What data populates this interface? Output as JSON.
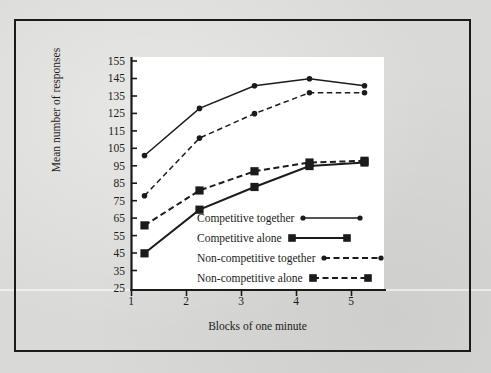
{
  "figure": {
    "background_color": "#d9d9d7",
    "panel_color": "#ffffff",
    "ink_color": "#1b1b1b"
  },
  "chart_data": {
    "type": "line",
    "title": "",
    "subtitle": "",
    "xlabel": "Blocks of one minute",
    "ylabel": "Mean number of responses",
    "categories": [
      "1",
      "2",
      "3",
      "4",
      "5"
    ],
    "x": [
      1,
      2,
      3,
      4,
      5
    ],
    "xlim": [
      0.6,
      5.6
    ],
    "ylim": [
      25,
      155
    ],
    "yticks": [
      25,
      35,
      45,
      55,
      65,
      75,
      85,
      95,
      105,
      115,
      125,
      135,
      145,
      155
    ],
    "xticks": [
      1,
      2,
      3,
      4,
      5
    ],
    "grid": false,
    "legend_position": "inside-lower-right",
    "series": [
      {
        "name": "Competitive together",
        "marker": "circle",
        "line_style": "solid",
        "color": "#1b1b1b",
        "values": [
          102,
          129,
          142,
          146,
          142
        ]
      },
      {
        "name": "Competitive alone",
        "marker": "square",
        "line_style": "solid",
        "color": "#1b1b1b",
        "values": [
          46,
          71,
          84,
          96,
          98
        ]
      },
      {
        "name": "Non-competitive together",
        "marker": "circle",
        "line_style": "dashed",
        "color": "#1b1b1b",
        "values": [
          79,
          112,
          126,
          138,
          138
        ]
      },
      {
        "name": "Non-competitive alone",
        "marker": "square",
        "line_style": "dashed",
        "color": "#1b1b1b",
        "values": [
          62,
          82,
          93,
          98,
          99
        ]
      }
    ]
  },
  "legend": {
    "entries": [
      {
        "label": "Competitive together"
      },
      {
        "label": "Competitive alone"
      },
      {
        "label": "Non-competitive together"
      },
      {
        "label": "Non-competitive alone"
      }
    ]
  },
  "axis_labels": {
    "y_tick_155": "155",
    "y_tick_145": "145",
    "y_tick_135": "135",
    "y_tick_125": "125",
    "y_tick_115": "115",
    "y_tick_105": "105",
    "y_tick_95": "95",
    "y_tick_85": "85",
    "y_tick_75": "75",
    "y_tick_65": "65",
    "y_tick_55": "55",
    "y_tick_45": "45",
    "y_tick_35": "35",
    "y_tick_25": "25",
    "x_tick_1": "1",
    "x_tick_2": "2",
    "x_tick_3": "3",
    "x_tick_4": "4",
    "x_tick_5": "5"
  }
}
